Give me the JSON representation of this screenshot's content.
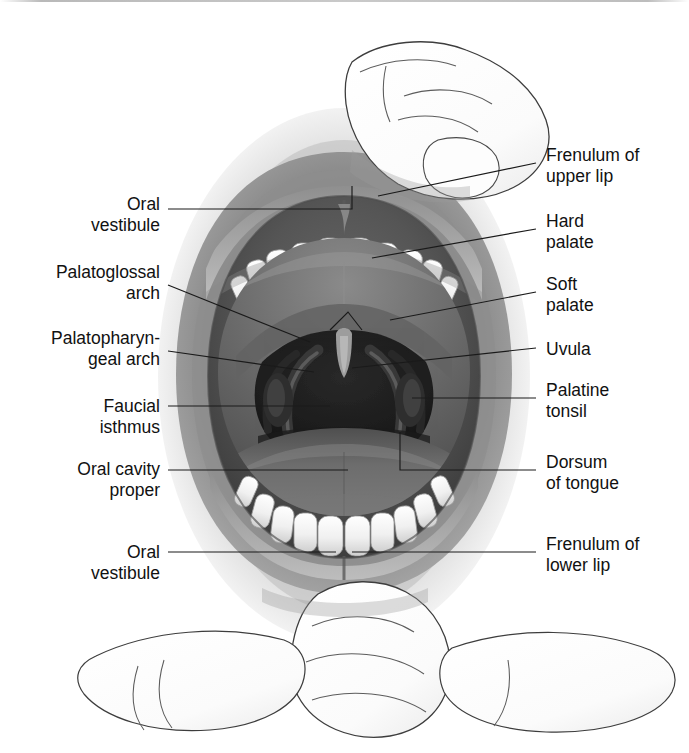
{
  "figure": {
    "style": "grayscale medical illustration",
    "colors": {
      "background": "#ffffff",
      "label_text": "#111111",
      "leader_line": "#1a1a1a",
      "skin_light": "#e9e9e9",
      "skin_mid": "#c2c2c2",
      "lip_dark": "#6f6f6f",
      "cavity_dark": "#4a4a4a",
      "throat_black": "#232323",
      "tooth_white": "#f6f6f6",
      "tongue": "#6b6b6b"
    }
  },
  "labels_left": [
    {
      "id": "oral-vestibule-upper",
      "text": "Oral\nvestibule"
    },
    {
      "id": "palatoglossal-arch",
      "text": "Palatoglossal\narch"
    },
    {
      "id": "palatopharyngeal-arch",
      "text": "Palatopharyn-\ngeal arch"
    },
    {
      "id": "faucial-isthmus",
      "text": "Faucial\nisthmus"
    },
    {
      "id": "oral-cavity-proper",
      "text": "Oral cavity\nproper"
    },
    {
      "id": "oral-vestibule-lower",
      "text": "Oral\nvestibule"
    }
  ],
  "labels_right": [
    {
      "id": "frenulum-upper-lip",
      "text": "Frenulum of\nupper lip"
    },
    {
      "id": "hard-palate",
      "text": "Hard\npalate"
    },
    {
      "id": "soft-palate",
      "text": "Soft\npalate"
    },
    {
      "id": "uvula",
      "text": "Uvula"
    },
    {
      "id": "palatine-tonsil",
      "text": "Palatine\ntonsil"
    },
    {
      "id": "dorsum-of-tongue",
      "text": "Dorsum\nof tongue"
    },
    {
      "id": "frenulum-lower-lip",
      "text": "Frenulum of\nlower lip"
    }
  ],
  "anatomy_parts": [
    "upper lip",
    "lower lip",
    "upper incisors",
    "lower incisors",
    "hard palate",
    "soft palate",
    "uvula",
    "palatoglossal arch",
    "palatopharyngeal arch",
    "palatine tonsil",
    "dorsum of tongue",
    "oropharynx",
    "thumb retracting upper lip",
    "finger retracting lower lip"
  ]
}
